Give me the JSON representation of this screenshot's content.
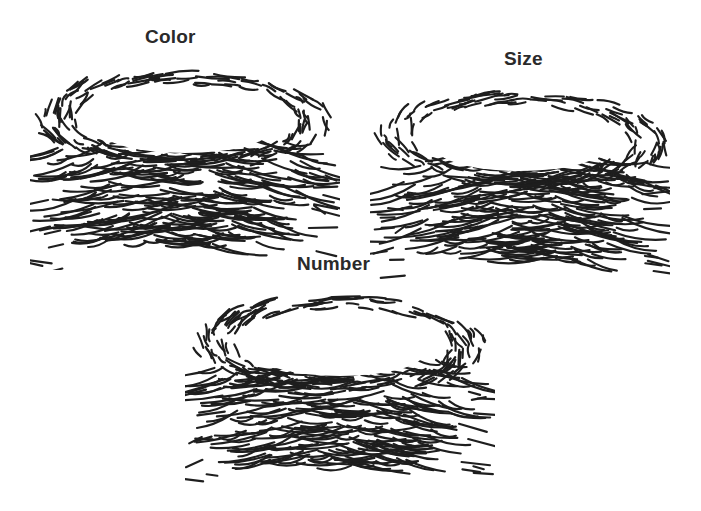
{
  "figure": {
    "panels": [
      {
        "id": "color",
        "label": "Color",
        "illustration": "empty-bird-nest"
      },
      {
        "id": "size",
        "label": "Size",
        "illustration": "empty-bird-nest"
      },
      {
        "id": "number",
        "label": "Number",
        "illustration": "empty-bird-nest"
      }
    ],
    "colors": {
      "ink": "#1e1e1e",
      "background": "#ffffff"
    }
  }
}
